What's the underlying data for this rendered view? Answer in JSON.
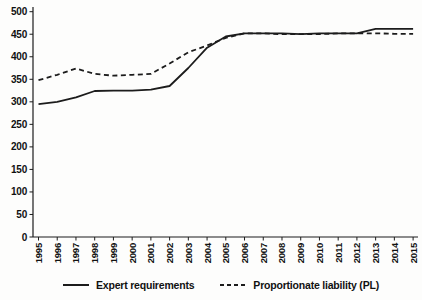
{
  "chart_data": {
    "type": "line",
    "title": "",
    "xlabel": "",
    "ylabel": "",
    "x": [
      1995,
      1996,
      1997,
      1998,
      1999,
      2000,
      2001,
      2002,
      2003,
      2004,
      2005,
      2006,
      2007,
      2008,
      2009,
      2010,
      2011,
      2012,
      2013,
      2014,
      2015
    ],
    "ylim": [
      0,
      500
    ],
    "ytick_step": 50,
    "grid": false,
    "legend_position": "bottom",
    "series": [
      {
        "name": "Expert requirements",
        "line_style": "solid",
        "color": "#1c1c1c",
        "values": [
          295,
          300,
          310,
          324,
          325,
          325,
          327,
          335,
          375,
          420,
          445,
          452,
          452,
          452,
          450,
          452,
          452,
          452,
          462,
          462,
          462
        ]
      },
      {
        "name": "Proportionate liability (PL)",
        "line_style": "dashed",
        "color": "#1c1c1c",
        "values": [
          348,
          360,
          374,
          362,
          358,
          360,
          362,
          385,
          410,
          425,
          442,
          452,
          452,
          450,
          450,
          450,
          452,
          452,
          452,
          451,
          451
        ]
      }
    ]
  },
  "colors": {
    "line": "#1c1c1c",
    "text": "#111111",
    "background": "#fdfdfc"
  }
}
